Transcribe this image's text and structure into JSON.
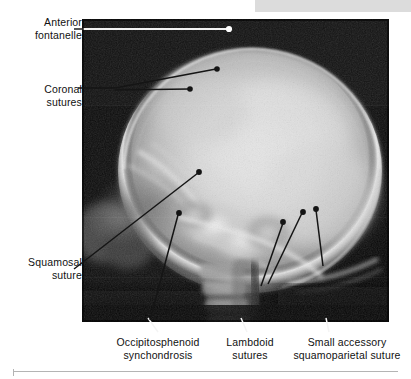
{
  "figure": {
    "kind": "labeled-radiograph",
    "modality": "plain film radiograph",
    "view": "lateral skull",
    "background_color": "#ffffff",
    "plate_color": "#070707",
    "label_color": "#111111",
    "leader_color_dark": "#141414",
    "leader_color_light": "#ffffff",
    "header_bar_color": "#dcdcdc",
    "rule_color": "#b4b4b4"
  },
  "annotations": [
    {
      "id": "anterior-fontanelle",
      "line1": "Anterior",
      "line2": "fontanelle",
      "leader_style": "light",
      "dot_color": "#ffffff",
      "points": 1
    },
    {
      "id": "coronal-sutures",
      "line1": "Coronal",
      "line2": "sutures",
      "leader_style": "dark",
      "dot_color": "#141414",
      "points": 2
    },
    {
      "id": "squamosal-suture",
      "line1": "Squamosal",
      "line2": "suture",
      "leader_style": "dark",
      "dot_color": "#141414",
      "points": 1
    },
    {
      "id": "occipitosphenoid-synchondrosis",
      "line1": "Occipitosphenoid",
      "line2": "synchondrosis",
      "leader_style": "dark",
      "dot_color": "#141414",
      "points": 1
    },
    {
      "id": "lambdoid-sutures",
      "line1": "Lambdoid",
      "line2": "sutures",
      "leader_style": "dark",
      "dot_color": "#141414",
      "points": 2
    },
    {
      "id": "small-accessory-squamoparietal-suture",
      "line1": "Small accessory",
      "line2": "squamoparietal suture",
      "leader_style": "dark",
      "dot_color": "#141414",
      "points": 1
    }
  ]
}
